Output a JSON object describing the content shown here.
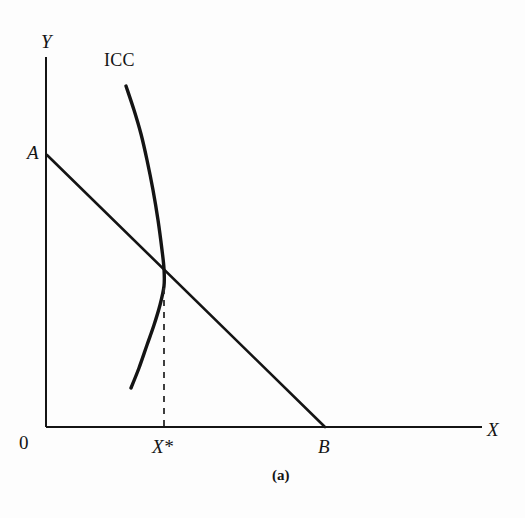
{
  "figure": {
    "caption": "(a)",
    "background_color": "#fdfdfd",
    "ink_color": "#141414"
  },
  "axes": {
    "y_label": "Y",
    "x_label": "X",
    "origin_label": "0"
  },
  "labels": {
    "icc_curve": "ICC",
    "point_a": "A",
    "point_b": "B",
    "x_star": "X*"
  },
  "chart_data": {
    "type": "line",
    "title": "",
    "subtitle": "",
    "xlabel": "X",
    "ylabel": "Y",
    "caption": "(a)",
    "grid": false,
    "legend": "none",
    "axis_style": "two-axis-open-corner",
    "origin_px": [
      46,
      427
    ],
    "x_axis_end_px": [
      482,
      427
    ],
    "y_axis_top_px": [
      46,
      57
    ],
    "annotations": [
      {
        "text": "Y",
        "role": "y-axis-label",
        "px": [
          47,
          42
        ]
      },
      {
        "text": "X",
        "role": "x-axis-label",
        "px": [
          492,
          430
        ]
      },
      {
        "text": "0",
        "role": "origin-label",
        "px": [
          25,
          442
        ]
      },
      {
        "text": "ICC",
        "role": "curve-label",
        "px": [
          122,
          61
        ]
      },
      {
        "text": "A",
        "role": "budget-line-y-intercept",
        "px": [
          33,
          153
        ]
      },
      {
        "text": "B",
        "role": "budget-line-x-intercept",
        "px": [
          324,
          447
        ]
      },
      {
        "text": "X*",
        "role": "equilibrium-quantity",
        "px": [
          164,
          447
        ]
      }
    ],
    "series": [
      {
        "name": "ICC",
        "description": "Income consumption curve, backward-bending (concave toward Y axis)",
        "stroke_width": 3.4,
        "points_px": [
          [
            126,
            86
          ],
          [
            134,
            110
          ],
          [
            141,
            134
          ],
          [
            147,
            160
          ],
          [
            153,
            190
          ],
          [
            158,
            220
          ],
          [
            162,
            250
          ],
          [
            164,
            269
          ],
          [
            164,
            286
          ],
          [
            160,
            305
          ],
          [
            154,
            325
          ],
          [
            147,
            345
          ],
          [
            139,
            368
          ],
          [
            131,
            388
          ]
        ]
      },
      {
        "name": "Budget line AB",
        "description": "Straight downward sloping budget constraint from A on Y axis to B on X axis",
        "stroke_width": 2.6,
        "points_px": [
          [
            47,
            155
          ],
          [
            325,
            427
          ]
        ]
      },
      {
        "name": "X* dropline",
        "description": "Vertical dashed line from equilibrium point down to X axis at X*",
        "stroke_width": 1.8,
        "dashed": true,
        "points_px": [
          [
            164,
            288
          ],
          [
            164,
            427
          ]
        ]
      }
    ],
    "intersection_px": [
      164,
      269
    ]
  }
}
